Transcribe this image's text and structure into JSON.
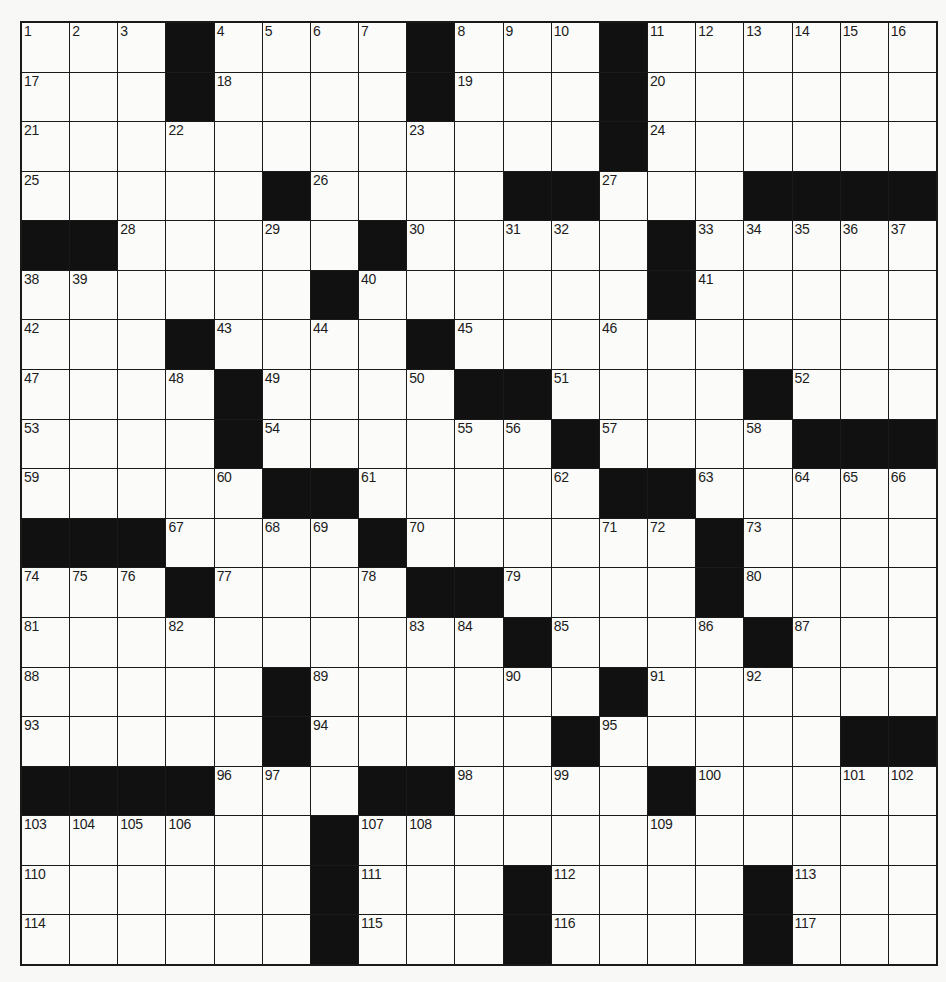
{
  "puzzle": {
    "rows": 19,
    "cols": 19,
    "colors": {
      "block": "#111111",
      "cell": "#fbfbfa",
      "line": "#1a1a1a",
      "background": "#f8f8f6"
    },
    "grid": [
      [
        "1",
        "2",
        "3",
        "#",
        "4",
        "5",
        "6",
        "7",
        "#",
        "8",
        "9",
        "10",
        "#",
        "11",
        "12",
        "13",
        "14",
        "15",
        "16"
      ],
      [
        "17",
        ".",
        ".",
        "#",
        "18",
        ".",
        ".",
        ".",
        "#",
        "19",
        ".",
        ".",
        "#",
        "20",
        ".",
        ".",
        ".",
        ".",
        "."
      ],
      [
        "21",
        ".",
        ".",
        "22",
        ".",
        ".",
        ".",
        ".",
        "23",
        ".",
        ".",
        ".",
        "#",
        "24",
        ".",
        ".",
        ".",
        ".",
        "."
      ],
      [
        "25",
        ".",
        ".",
        ".",
        ".",
        "#",
        "26",
        ".",
        ".",
        ".",
        "#",
        "#",
        "27",
        ".",
        ".",
        "#",
        "#",
        "#",
        "#"
      ],
      [
        "#",
        "#",
        "28",
        ".",
        ".",
        "29",
        ".",
        "#",
        "30",
        ".",
        "31",
        "32",
        ".",
        "#",
        "33",
        "34",
        "35",
        "36",
        "37"
      ],
      [
        "38",
        "39",
        ".",
        ".",
        ".",
        ".",
        "#",
        "40",
        ".",
        ".",
        ".",
        ".",
        ".",
        "#",
        "41",
        ".",
        ".",
        ".",
        "."
      ],
      [
        "42",
        ".",
        ".",
        "#",
        "43",
        ".",
        "44",
        ".",
        "#",
        "45",
        ".",
        ".",
        "46",
        ".",
        ".",
        ".",
        ".",
        ".",
        "."
      ],
      [
        "47",
        ".",
        ".",
        "48",
        "#",
        "49",
        ".",
        ".",
        "50",
        "#",
        "#",
        "51",
        ".",
        ".",
        ".",
        "#",
        "52",
        ".",
        "."
      ],
      [
        "53",
        ".",
        ".",
        ".",
        "#",
        "54",
        ".",
        ".",
        ".",
        "55",
        "56",
        "#",
        "57",
        ".",
        ".",
        "58",
        "#",
        "#",
        "#"
      ],
      [
        "59",
        ".",
        ".",
        ".",
        "60",
        "#",
        "#",
        "61",
        ".",
        ".",
        ".",
        "62",
        "#",
        "#",
        "63",
        ".",
        "64",
        "65",
        "66"
      ],
      [
        "#",
        "#",
        "#",
        "67",
        ".",
        "68",
        "69",
        "#",
        "70",
        ".",
        ".",
        ".",
        "71",
        "72",
        "#",
        "73",
        ".",
        ".",
        "."
      ],
      [
        "74",
        "75",
        "76",
        "#",
        "77",
        ".",
        ".",
        "78",
        "#",
        "#",
        "79",
        ".",
        ".",
        ".",
        "#",
        "80",
        ".",
        ".",
        "."
      ],
      [
        "81",
        ".",
        ".",
        "82",
        ".",
        ".",
        ".",
        ".",
        "83",
        "84",
        "#",
        "85",
        ".",
        ".",
        "86",
        "#",
        "87",
        ".",
        "."
      ],
      [
        "88",
        ".",
        ".",
        ".",
        ".",
        "#",
        "89",
        ".",
        ".",
        ".",
        "90",
        ".",
        "#",
        "91",
        ".",
        "92",
        ".",
        ".",
        "."
      ],
      [
        "93",
        ".",
        ".",
        ".",
        ".",
        "#",
        "94",
        ".",
        ".",
        ".",
        ".",
        "#",
        "95",
        ".",
        ".",
        ".",
        ".",
        "#",
        "#"
      ],
      [
        "#",
        "#",
        "#",
        "#",
        "96",
        "97",
        ".",
        "#",
        "#",
        "98",
        ".",
        "99",
        ".",
        "#",
        "100",
        ".",
        ".",
        "101",
        "102"
      ],
      [
        "103",
        "104",
        "105",
        "106",
        ".",
        ".",
        "#",
        "107",
        "108",
        ".",
        ".",
        ".",
        ".",
        "109",
        ".",
        ".",
        ".",
        ".",
        "."
      ],
      [
        "110",
        ".",
        ".",
        ".",
        ".",
        ".",
        "#",
        "111",
        ".",
        ".",
        "#",
        "112",
        ".",
        ".",
        ".",
        "#",
        "113",
        ".",
        "."
      ],
      [
        "114",
        ".",
        ".",
        ".",
        ".",
        ".",
        "#",
        "115",
        ".",
        ".",
        "#",
        "116",
        ".",
        ".",
        ".",
        "#",
        "117",
        ".",
        "."
      ]
    ]
  }
}
